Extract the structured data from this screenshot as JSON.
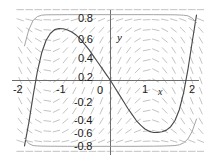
{
  "figure": {
    "kind": "slope-field-plot",
    "background_color": "#ffffff",
    "axis_color": "#6e6e6e",
    "curve_color": "#4a4a4a",
    "secondary_curve_color": "#9a9a9a",
    "field_color": "#b8b8b8",
    "axis_label_x": "x",
    "axis_label_y": "y"
  },
  "chart_data": {
    "type": "line",
    "title": "",
    "xlabel": "x",
    "ylabel": "y",
    "xlim": [
      -2.15,
      2.15
    ],
    "ylim": [
      -0.95,
      0.95
    ],
    "grid": false,
    "legend": null,
    "xticks": [
      -2,
      -1,
      0,
      1,
      2
    ],
    "xticklabels": [
      "-2",
      "-1",
      "0",
      "1",
      "2"
    ],
    "yticks": [
      0.8,
      0.6,
      0.4,
      0.2,
      0,
      -0.2,
      -0.4,
      -0.6,
      -0.8
    ],
    "yticklabels": [
      "0.8",
      "0.6",
      "0.4",
      "0.2",
      "0",
      "-0.2",
      "-0.4",
      "-0.6",
      "-0.8"
    ],
    "series": [
      {
        "name": "solution-curve",
        "style": "solid-dark",
        "x": [
          -2.0,
          -1.9,
          -1.8,
          -1.7,
          -1.6,
          -1.5,
          -1.4,
          -1.3,
          -1.2,
          -1.1,
          -1.0,
          -0.9,
          -0.8,
          -0.7,
          -0.6,
          -0.5,
          -0.4,
          -0.3,
          -0.2,
          -0.1,
          0.0,
          0.1,
          0.2,
          0.3,
          0.4,
          0.5,
          0.6,
          0.7,
          0.8,
          0.9,
          1.0,
          1.1,
          1.2,
          1.3,
          1.4,
          1.5,
          1.6,
          1.7,
          1.8,
          1.9,
          2.0
        ],
        "y": [
          -0.85,
          -0.55,
          -0.2,
          0.12,
          0.36,
          0.52,
          0.61,
          0.66,
          0.675,
          0.672,
          0.655,
          0.63,
          0.59,
          0.54,
          0.47,
          0.4,
          0.32,
          0.24,
          0.16,
          0.08,
          0.0,
          -0.09,
          -0.18,
          -0.27,
          -0.36,
          -0.44,
          -0.52,
          -0.58,
          -0.63,
          -0.66,
          -0.675,
          -0.675,
          -0.665,
          -0.645,
          -0.6,
          -0.52,
          -0.38,
          -0.16,
          0.14,
          0.5,
          0.85
        ]
      },
      {
        "name": "outer-equilibrium-curve",
        "style": "solid-light",
        "x": [
          -2.0,
          -1.9,
          -1.8,
          -1.7,
          -1.6,
          -1.5,
          -1.0,
          -0.5,
          0.0,
          0.5,
          1.0,
          1.3,
          1.5,
          1.6,
          1.7,
          1.8,
          1.9,
          2.0
        ],
        "y": [
          -0.75,
          -0.82,
          -0.845,
          -0.85,
          -0.852,
          -0.853,
          -0.855,
          -0.855,
          -0.855,
          -0.855,
          -0.853,
          -0.85,
          -0.845,
          -0.835,
          -0.81,
          -0.76,
          -0.66,
          -0.5
        ]
      },
      {
        "name": "upper-equilibrium-curve",
        "style": "solid-light",
        "x": [
          -2.0,
          -1.9,
          -1.8,
          -1.7,
          -1.6,
          -1.5,
          -1.0,
          -0.5,
          0.0,
          0.5,
          1.0,
          1.5,
          1.7,
          1.8,
          1.9,
          2.0
        ],
        "y": [
          0.45,
          0.66,
          0.78,
          0.83,
          0.848,
          0.853,
          0.855,
          0.855,
          0.855,
          0.855,
          0.855,
          0.853,
          0.848,
          0.84,
          0.81,
          0.75
        ]
      }
    ],
    "slope_field": {
      "description": "grid of short dashes showing dy/dx direction",
      "x_range": [
        -2.1,
        2.1
      ],
      "y_range": [
        -0.92,
        0.92
      ],
      "x_count": 21,
      "y_count": 15
    }
  }
}
